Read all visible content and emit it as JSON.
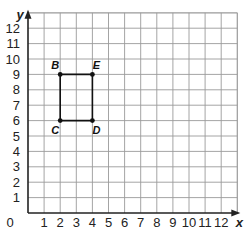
{
  "chart_data": {
    "type": "scatter",
    "title": "",
    "xlabel": "x",
    "ylabel": "y",
    "xlim": [
      0,
      13
    ],
    "ylim": [
      0,
      13
    ],
    "grid": true,
    "x_ticks": [
      "1",
      "2",
      "3",
      "4",
      "5",
      "6",
      "7",
      "8",
      "9",
      "10",
      "11",
      "12"
    ],
    "y_ticks": [
      "1",
      "2",
      "3",
      "4",
      "5",
      "6",
      "7",
      "8",
      "9",
      "10",
      "11",
      "12"
    ],
    "origin_label": "0",
    "points": [
      {
        "label": "B",
        "x": 2,
        "y": 9
      },
      {
        "label": "E",
        "x": 4,
        "y": 9
      },
      {
        "label": "D",
        "x": 4,
        "y": 6
      },
      {
        "label": "C",
        "x": 2,
        "y": 6
      }
    ],
    "polygon": {
      "name": "rectangle BEDC",
      "vertices": [
        "B",
        "E",
        "D",
        "C"
      ],
      "closed": true
    }
  },
  "colors": {
    "grid": "#9a9a9a",
    "axis": "#222222",
    "shape": "#111111",
    "background": "#ffffff"
  }
}
